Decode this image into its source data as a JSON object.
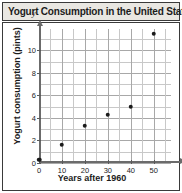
{
  "header": {
    "title": "Yogurt Consumption in the United States"
  },
  "chart_data": {
    "type": "scatter",
    "title": "Yogurt Consumption in the United States",
    "xlabel": "Years after 1960",
    "ylabel": "Yogurt consumption (pints)",
    "x_axis_variable": "x",
    "y_axis_variable": "y",
    "xlim": [
      0,
      57.5
    ],
    "ylim": [
      0,
      11.9
    ],
    "grid": true,
    "legend": null,
    "x_ticks": [
      0,
      10,
      20,
      30,
      40,
      50
    ],
    "y_ticks": [
      0,
      2,
      4,
      6,
      8,
      10
    ],
    "x_gridlines": [
      0,
      5,
      10,
      15,
      20,
      25,
      30,
      35,
      40,
      45,
      50,
      55
    ],
    "y_gridlines": [
      0,
      1,
      2,
      3,
      4,
      5,
      6,
      7,
      8,
      9,
      10,
      11
    ],
    "x": [
      0,
      10,
      20,
      30,
      40,
      50
    ],
    "values": [
      0.3,
      1.6,
      3.3,
      4.3,
      5.0,
      11.5
    ],
    "points": [
      {
        "x": 0,
        "y": 0.3
      },
      {
        "x": 10,
        "y": 1.6
      },
      {
        "x": 20,
        "y": 3.3
      },
      {
        "x": 30,
        "y": 4.3
      },
      {
        "x": 40,
        "y": 5.0
      },
      {
        "x": 50,
        "y": 11.5
      }
    ],
    "point_color": "#1a1a1a",
    "grid_color": "#c8c8c8",
    "axis_color": "#6b6b6b"
  },
  "style": {
    "title_bar_background": "#e9e7e2",
    "border_color": "#3a3a3a",
    "plot_background": "#ffffff",
    "text_color": "#1c1c1c"
  }
}
